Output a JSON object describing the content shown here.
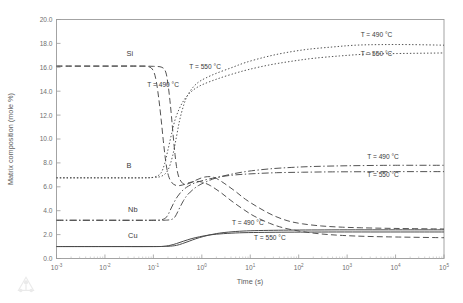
{
  "chart_data": {
    "type": "line",
    "title": "",
    "xlabel": "Time (s)",
    "ylabel": "Matrix composition (mole %)",
    "xscale": "log",
    "xlim": [
      0.001,
      100000
    ],
    "ylim": [
      0,
      20
    ],
    "grid": false,
    "legend_position": "inline-annotations",
    "xticks": [
      {
        "value": 0.001,
        "mantissa": "10",
        "exponent": "-3"
      },
      {
        "value": 0.01,
        "mantissa": "10",
        "exponent": "-2"
      },
      {
        "value": 0.1,
        "mantissa": "10",
        "exponent": "-1"
      },
      {
        "value": 1,
        "mantissa": "10",
        "exponent": "0"
      },
      {
        "value": 10,
        "mantissa": "10",
        "exponent": "1"
      },
      {
        "value": 100,
        "mantissa": "10",
        "exponent": "2"
      },
      {
        "value": 1000,
        "mantissa": "10",
        "exponent": "3"
      },
      {
        "value": 10000,
        "mantissa": "10",
        "exponent": "4"
      },
      {
        "value": 100000,
        "mantissa": "10",
        "exponent": "5"
      }
    ],
    "yticks": [
      {
        "value": 0,
        "label": "0.0"
      },
      {
        "value": 2,
        "label": "2.0"
      },
      {
        "value": 4,
        "label": "4.0"
      },
      {
        "value": 6,
        "label": "6.0"
      },
      {
        "value": 8,
        "label": "8.0"
      },
      {
        "value": 10,
        "label": "10.0"
      },
      {
        "value": 12,
        "label": "12.0"
      },
      {
        "value": 14,
        "label": "14.0"
      },
      {
        "value": 16,
        "label": "16.0"
      },
      {
        "value": 18,
        "label": "18.0"
      },
      {
        "value": 20,
        "label": "20.0"
      }
    ],
    "element_labels": [
      {
        "text": "Si",
        "x": 0.028,
        "y": 16.95
      },
      {
        "text": "B",
        "x": 0.028,
        "y": 7.55
      },
      {
        "text": "Nb",
        "x": 0.03,
        "y": 3.85
      },
      {
        "text": "Cu",
        "x": 0.03,
        "y": 1.75
      }
    ],
    "annotations": [
      {
        "text": "T = 550 °C",
        "x": 0.55,
        "y": 15.85,
        "anchor": "start"
      },
      {
        "text": "T = 490 °C",
        "x": 0.075,
        "y": 14.35,
        "anchor": "start"
      },
      {
        "text": "T = 490 °C",
        "x": 1900,
        "y": 18.55,
        "anchor": "start"
      },
      {
        "text": "T = 550 °C",
        "x": 1900,
        "y": 16.95,
        "anchor": "start"
      },
      {
        "text": "T = 490 °C",
        "x": 2600,
        "y": 8.35,
        "anchor": "start"
      },
      {
        "text": "T = 550 °C",
        "x": 2600,
        "y": 6.85,
        "anchor": "start"
      },
      {
        "text": "T = 490 °C",
        "x": 4.2,
        "y": 2.78,
        "anchor": "start"
      },
      {
        "text": "T = 550 °C",
        "x": 12,
        "y": 1.58,
        "anchor": "start"
      }
    ],
    "series": [
      {
        "name": "Si 490",
        "element": "Si",
        "temperature": "490 °C",
        "style": "dashed",
        "dash": "6,3.2",
        "width": 0.95,
        "color": "#3f3f3f",
        "points": [
          [
            0.001,
            16.1
          ],
          [
            0.01,
            16.1
          ],
          [
            0.05,
            16.1
          ],
          [
            0.1,
            16.08
          ],
          [
            0.15,
            16.0
          ],
          [
            0.18,
            15.6
          ],
          [
            0.2,
            14.6
          ],
          [
            0.22,
            13.2
          ],
          [
            0.24,
            11.6
          ],
          [
            0.26,
            10.0
          ],
          [
            0.28,
            8.7
          ],
          [
            0.3,
            7.7
          ],
          [
            0.33,
            6.9
          ],
          [
            0.38,
            6.4
          ],
          [
            0.45,
            6.2
          ],
          [
            0.6,
            6.35
          ],
          [
            0.8,
            6.6
          ],
          [
            1.1,
            6.8
          ],
          [
            1.5,
            6.85
          ],
          [
            2,
            6.7
          ],
          [
            3,
            6.25
          ],
          [
            5,
            5.6
          ],
          [
            8,
            4.95
          ],
          [
            15,
            4.25
          ],
          [
            30,
            3.6
          ],
          [
            60,
            3.15
          ],
          [
            120,
            2.9
          ],
          [
            300,
            2.72
          ],
          [
            800,
            2.62
          ],
          [
            2000,
            2.57
          ],
          [
            6000,
            2.53
          ],
          [
            20000,
            2.5
          ],
          [
            100000,
            2.47
          ]
        ]
      },
      {
        "name": "Si 550",
        "element": "Si",
        "temperature": "550 °C",
        "style": "dashed",
        "dash": "6,3.2",
        "width": 0.95,
        "color": "#3f3f3f",
        "points": [
          [
            0.001,
            16.1
          ],
          [
            0.01,
            16.1
          ],
          [
            0.05,
            16.1
          ],
          [
            0.08,
            16.05
          ],
          [
            0.1,
            15.7
          ],
          [
            0.115,
            14.8
          ],
          [
            0.13,
            13.3
          ],
          [
            0.145,
            11.6
          ],
          [
            0.16,
            9.9
          ],
          [
            0.175,
            8.5
          ],
          [
            0.19,
            7.5
          ],
          [
            0.21,
            6.8
          ],
          [
            0.24,
            6.35
          ],
          [
            0.3,
            6.1
          ],
          [
            0.4,
            6.15
          ],
          [
            0.55,
            6.35
          ],
          [
            0.75,
            6.45
          ],
          [
            1,
            6.4
          ],
          [
            1.5,
            6.1
          ],
          [
            2.5,
            5.5
          ],
          [
            4,
            4.85
          ],
          [
            7,
            4.15
          ],
          [
            12,
            3.55
          ],
          [
            25,
            2.95
          ],
          [
            50,
            2.55
          ],
          [
            120,
            2.25
          ],
          [
            300,
            2.05
          ],
          [
            800,
            1.93
          ],
          [
            2500,
            1.85
          ],
          [
            10000,
            1.8
          ],
          [
            100000,
            1.74
          ]
        ]
      },
      {
        "name": "B 490",
        "element": "B",
        "temperature": "490 °C",
        "style": "dotted",
        "dash": "1.4,2.0",
        "width": 0.95,
        "color": "#5a5a5a",
        "points": [
          [
            0.001,
            6.75
          ],
          [
            0.01,
            6.75
          ],
          [
            0.05,
            6.75
          ],
          [
            0.1,
            6.78
          ],
          [
            0.15,
            6.9
          ],
          [
            0.2,
            7.4
          ],
          [
            0.25,
            8.6
          ],
          [
            0.3,
            10.2
          ],
          [
            0.35,
            11.6
          ],
          [
            0.42,
            12.8
          ],
          [
            0.5,
            13.6
          ],
          [
            0.65,
            14.3
          ],
          [
            0.85,
            14.75
          ],
          [
            1.2,
            15.1
          ],
          [
            2,
            15.5
          ],
          [
            4,
            15.95
          ],
          [
            8,
            16.4
          ],
          [
            20,
            16.85
          ],
          [
            50,
            17.2
          ],
          [
            150,
            17.5
          ],
          [
            500,
            17.7
          ],
          [
            1500,
            17.85
          ],
          [
            5000,
            17.9
          ],
          [
            20000,
            17.9
          ],
          [
            100000,
            17.85
          ]
        ]
      },
      {
        "name": "B 550",
        "element": "B",
        "temperature": "550 °C",
        "style": "dotted",
        "dash": "1.4,2.0",
        "width": 0.95,
        "color": "#5a5a5a",
        "points": [
          [
            0.001,
            6.75
          ],
          [
            0.01,
            6.75
          ],
          [
            0.06,
            6.75
          ],
          [
            0.1,
            6.8
          ],
          [
            0.14,
            7.1
          ],
          [
            0.17,
            7.9
          ],
          [
            0.2,
            9.1
          ],
          [
            0.24,
            10.5
          ],
          [
            0.28,
            11.6
          ],
          [
            0.34,
            12.5
          ],
          [
            0.42,
            13.2
          ],
          [
            0.55,
            13.8
          ],
          [
            0.75,
            14.25
          ],
          [
            1.1,
            14.6
          ],
          [
            2,
            15.0
          ],
          [
            4,
            15.4
          ],
          [
            9,
            15.8
          ],
          [
            25,
            16.2
          ],
          [
            70,
            16.5
          ],
          [
            200,
            16.75
          ],
          [
            700,
            16.95
          ],
          [
            2500,
            17.1
          ],
          [
            10000,
            17.15
          ],
          [
            100000,
            17.2
          ]
        ]
      },
      {
        "name": "Nb 490",
        "element": "Nb",
        "temperature": "490 °C",
        "style": "dashdot",
        "dash": "7,2.4,1.4,2.4",
        "width": 0.95,
        "color": "#4a4a4a",
        "points": [
          [
            0.001,
            3.2
          ],
          [
            0.01,
            3.2
          ],
          [
            0.1,
            3.2
          ],
          [
            0.2,
            3.22
          ],
          [
            0.26,
            3.35
          ],
          [
            0.3,
            3.7
          ],
          [
            0.35,
            4.25
          ],
          [
            0.42,
            4.85
          ],
          [
            0.5,
            5.3
          ],
          [
            0.65,
            5.75
          ],
          [
            0.85,
            6.1
          ],
          [
            1.2,
            6.4
          ],
          [
            2,
            6.75
          ],
          [
            4,
            7.05
          ],
          [
            9,
            7.3
          ],
          [
            25,
            7.5
          ],
          [
            70,
            7.62
          ],
          [
            200,
            7.7
          ],
          [
            700,
            7.75
          ],
          [
            2500,
            7.78
          ],
          [
            10000,
            7.8
          ],
          [
            100000,
            7.8
          ]
        ]
      },
      {
        "name": "Nb 550",
        "element": "Nb",
        "temperature": "550 °C",
        "style": "dashdot",
        "dash": "7,2.4,1.4,2.4",
        "width": 0.95,
        "color": "#4a4a4a",
        "points": [
          [
            0.001,
            3.2
          ],
          [
            0.01,
            3.2
          ],
          [
            0.1,
            3.2
          ],
          [
            0.15,
            3.25
          ],
          [
            0.19,
            3.5
          ],
          [
            0.22,
            4.0
          ],
          [
            0.26,
            4.6
          ],
          [
            0.31,
            5.15
          ],
          [
            0.38,
            5.6
          ],
          [
            0.48,
            5.95
          ],
          [
            0.65,
            6.25
          ],
          [
            0.9,
            6.45
          ],
          [
            1.4,
            6.65
          ],
          [
            2.5,
            6.85
          ],
          [
            5,
            7.0
          ],
          [
            12,
            7.1
          ],
          [
            35,
            7.18
          ],
          [
            120,
            7.22
          ],
          [
            500,
            7.25
          ],
          [
            2000,
            7.26
          ],
          [
            10000,
            7.27
          ],
          [
            100000,
            7.27
          ]
        ]
      },
      {
        "name": "Cu 490",
        "element": "Cu",
        "temperature": "490 °C",
        "style": "solid",
        "dash": "",
        "width": 1.0,
        "color": "#4a4a4a",
        "points": [
          [
            0.001,
            1.0
          ],
          [
            0.01,
            1.0
          ],
          [
            0.1,
            1.0
          ],
          [
            0.2,
            1.02
          ],
          [
            0.3,
            1.1
          ],
          [
            0.4,
            1.25
          ],
          [
            0.55,
            1.45
          ],
          [
            0.75,
            1.65
          ],
          [
            1.1,
            1.85
          ],
          [
            1.8,
            2.05
          ],
          [
            3,
            2.18
          ],
          [
            6,
            2.28
          ],
          [
            12,
            2.33
          ],
          [
            30,
            2.36
          ],
          [
            80,
            2.38
          ],
          [
            250,
            2.39
          ],
          [
            1000,
            2.4
          ],
          [
            5000,
            2.4
          ],
          [
            20000,
            2.4
          ],
          [
            100000,
            2.4
          ]
        ]
      },
      {
        "name": "Cu 550",
        "element": "Cu",
        "temperature": "550 °C",
        "style": "solid",
        "dash": "",
        "width": 1.0,
        "color": "#4a4a4a",
        "points": [
          [
            0.001,
            1.0
          ],
          [
            0.01,
            1.0
          ],
          [
            0.1,
            1.0
          ],
          [
            0.16,
            1.02
          ],
          [
            0.22,
            1.1
          ],
          [
            0.3,
            1.25
          ],
          [
            0.42,
            1.45
          ],
          [
            0.6,
            1.65
          ],
          [
            0.9,
            1.82
          ],
          [
            1.5,
            1.98
          ],
          [
            2.8,
            2.08
          ],
          [
            6,
            2.15
          ],
          [
            15,
            2.18
          ],
          [
            45,
            2.2
          ],
          [
            150,
            2.21
          ],
          [
            600,
            2.22
          ],
          [
            3000,
            2.22
          ],
          [
            20000,
            2.22
          ],
          [
            100000,
            2.22
          ]
        ]
      }
    ]
  },
  "watermark": {
    "name": "triangular-logo"
  }
}
